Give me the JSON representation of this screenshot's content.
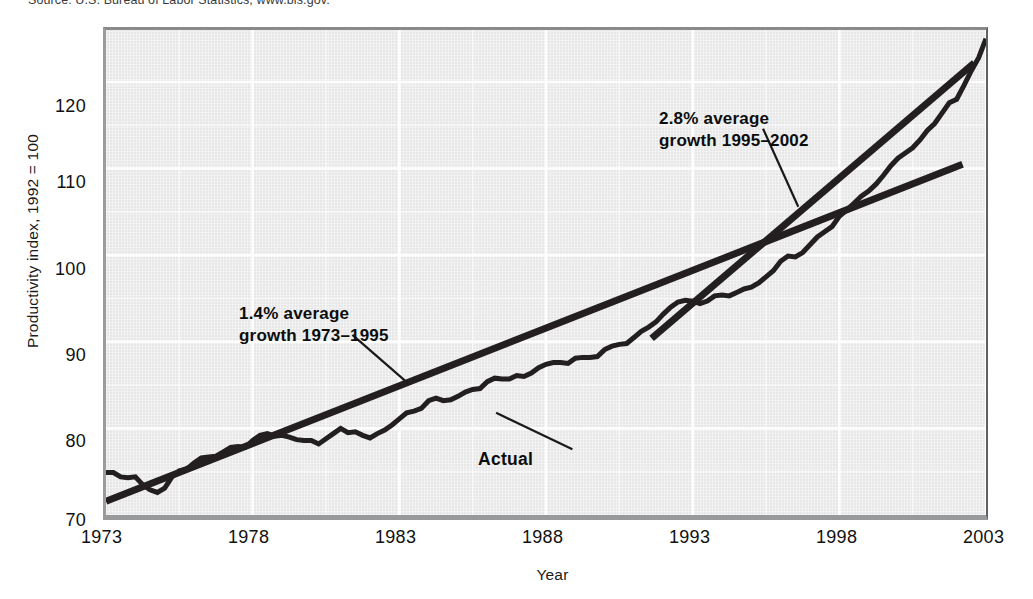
{
  "source_note": "Source: U.S. Bureau of Labor Statistics, www.bls.gov.",
  "axes": {
    "ylabel": "Productivity index, 1992 = 100",
    "xlabel": "Year",
    "yticks": [
      "70",
      "80",
      "90",
      "100",
      "110",
      "120"
    ],
    "xticks": [
      "1973",
      "1978",
      "1983",
      "1988",
      "1993",
      "1998",
      "2003"
    ]
  },
  "annotations": {
    "slow_growth_line1": "1.4% average",
    "slow_growth_line2": "growth 1973–1995",
    "fast_growth_line1": "2.8% average",
    "fast_growth_line2": "growth 1995–2002",
    "actual_label": "Actual"
  },
  "colors": {
    "series": "#231f20",
    "trend": "#231f20",
    "plot_background": "#ededed",
    "gridline": "#ffffff",
    "text": "#111111"
  },
  "chart_data": {
    "type": "line",
    "title": "",
    "subtitle": "",
    "xlabel": "Year",
    "ylabel": "Productivity index, 1992 = 100",
    "xlim": [
      1973,
      2003
    ],
    "ylim": [
      70,
      126
    ],
    "grid": true,
    "legend": "none",
    "yticks": [
      70,
      80,
      90,
      100,
      110,
      120
    ],
    "xticks": [
      1973,
      1978,
      1983,
      1988,
      1993,
      1998,
      2003
    ],
    "annotations": [
      {
        "text": "1.4% average growth 1973–1995",
        "text_x": 1979.0,
        "text_y": 94.0,
        "leader_from": [
          1981.4,
          90.8
        ],
        "leader_to": [
          1983.3,
          85.2
        ]
      },
      {
        "text": "2.8% average growth 1995–2002",
        "text_x": 1993.3,
        "text_y": 120.0,
        "leader_from": [
          1995.4,
          114.6
        ],
        "leader_to": [
          1996.6,
          105.6
        ]
      },
      {
        "text": "Actual",
        "text_x": 1989.2,
        "text_y": 76.6,
        "leader_from": [
          1988.9,
          77.6
        ],
        "leader_to": [
          1986.3,
          81.8
        ]
      }
    ],
    "series": [
      {
        "name": "Actual",
        "type": "line",
        "linewidth": 5,
        "x": [
          1973.0,
          1973.25,
          1973.5,
          1973.75,
          1974.0,
          1974.25,
          1974.5,
          1974.75,
          1975.0,
          1975.25,
          1975.5,
          1975.75,
          1976.0,
          1976.25,
          1976.5,
          1976.75,
          1977.0,
          1977.25,
          1977.5,
          1977.75,
          1978.0,
          1978.25,
          1978.5,
          1978.75,
          1979.0,
          1979.25,
          1979.5,
          1979.75,
          1980.0,
          1980.25,
          1980.5,
          1980.75,
          1981.0,
          1981.25,
          1981.5,
          1981.75,
          1982.0,
          1982.25,
          1982.5,
          1982.75,
          1983.0,
          1983.25,
          1983.5,
          1983.75,
          1984.0,
          1984.25,
          1984.5,
          1984.75,
          1985.0,
          1985.25,
          1985.5,
          1985.75,
          1986.0,
          1986.25,
          1986.5,
          1986.75,
          1987.0,
          1987.25,
          1987.5,
          1987.75,
          1988.0,
          1988.25,
          1988.5,
          1988.75,
          1989.0,
          1989.25,
          1989.5,
          1989.75,
          1990.0,
          1990.25,
          1990.5,
          1990.75,
          1991.0,
          1991.25,
          1991.5,
          1991.75,
          1992.0,
          1992.25,
          1992.5,
          1992.75,
          1993.0,
          1993.25,
          1993.5,
          1993.75,
          1994.0,
          1994.25,
          1994.5,
          1994.75,
          1995.0,
          1995.25,
          1995.5,
          1995.75,
          1996.0,
          1996.25,
          1996.5,
          1996.75,
          1997.0,
          1997.25,
          1997.5,
          1997.75,
          1998.0,
          1998.25,
          1998.5,
          1998.75,
          1999.0,
          1999.25,
          1999.5,
          1999.75,
          2000.0,
          2000.25,
          2000.5,
          2000.75,
          2001.0,
          2001.25,
          2001.5,
          2001.75,
          2002.0,
          2002.25,
          2002.5,
          2002.75,
          2003.0
        ],
        "y": [
          74.9,
          74.9,
          74.4,
          74.3,
          74.4,
          73.5,
          72.9,
          72.6,
          73.1,
          74.4,
          75.1,
          75.3,
          76.0,
          76.6,
          76.7,
          76.8,
          77.3,
          77.8,
          77.9,
          77.8,
          78.6,
          79.2,
          79.4,
          79.1,
          79.2,
          79.0,
          78.7,
          78.6,
          78.6,
          78.2,
          78.8,
          79.4,
          80.0,
          79.5,
          79.6,
          79.2,
          78.9,
          79.4,
          79.8,
          80.4,
          81.1,
          81.8,
          82.0,
          82.3,
          83.2,
          83.5,
          83.2,
          83.3,
          83.7,
          84.2,
          84.5,
          84.6,
          85.4,
          85.8,
          85.7,
          85.7,
          86.1,
          86.0,
          86.4,
          87.0,
          87.4,
          87.6,
          87.6,
          87.5,
          88.1,
          88.2,
          88.2,
          88.3,
          89.1,
          89.5,
          89.7,
          89.8,
          90.5,
          91.2,
          91.7,
          92.3,
          93.2,
          94.0,
          94.6,
          94.8,
          94.7,
          94.4,
          94.7,
          95.3,
          95.4,
          95.3,
          95.7,
          96.1,
          96.3,
          96.8,
          97.5,
          98.2,
          99.3,
          99.9,
          99.8,
          100.3,
          101.2,
          102.1,
          102.7,
          103.3,
          104.5,
          105.2,
          106.0,
          106.8,
          107.4,
          108.2,
          109.2,
          110.3,
          111.2,
          111.8,
          112.4,
          113.3,
          114.4,
          115.2,
          116.4,
          117.6,
          118.0,
          119.6,
          121.3,
          122.8,
          125.0
        ]
      },
      {
        "name": "1.4% trend 1973-1995",
        "type": "trendline",
        "linewidth": 7,
        "growth_pct": 1.4,
        "x": [
          1973.0,
          2002.2
        ],
        "y": [
          71.6,
          110.5
        ]
      },
      {
        "name": "2.8% trend 1995-2002",
        "type": "trendline",
        "linewidth": 7,
        "growth_pct": 2.8,
        "x": [
          1991.6,
          2002.6
        ],
        "y": [
          90.4,
          122.2
        ]
      }
    ]
  }
}
